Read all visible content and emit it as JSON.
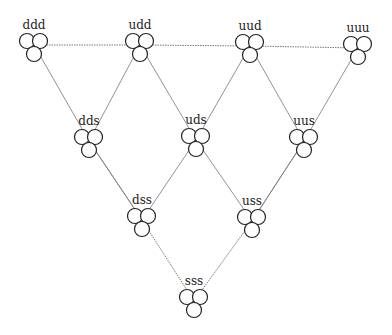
{
  "diagram": {
    "title": "",
    "nodes": [
      {
        "id": "ddd",
        "label": "ddd",
        "x": 34,
        "y": 45
      },
      {
        "id": "udd",
        "label": "udd",
        "x": 140,
        "y": 45
      },
      {
        "id": "uud",
        "label": "uud",
        "x": 250,
        "y": 46
      },
      {
        "id": "uuu",
        "label": "uuu",
        "x": 358,
        "y": 48
      },
      {
        "id": "dds",
        "label": "dds",
        "x": 89,
        "y": 141
      },
      {
        "id": "uds",
        "label": "uds",
        "x": 196,
        "y": 140
      },
      {
        "id": "uus",
        "label": "uus",
        "x": 304,
        "y": 141
      },
      {
        "id": "dss",
        "label": "dss",
        "x": 142,
        "y": 220
      },
      {
        "id": "uss",
        "label": "uss",
        "x": 252,
        "y": 221
      },
      {
        "id": "sss",
        "label": "sss",
        "x": 194,
        "y": 301
      }
    ],
    "edges": [
      {
        "from": "ddd",
        "to": "udd",
        "style": "dotted"
      },
      {
        "from": "udd",
        "to": "uud",
        "style": "dotted"
      },
      {
        "from": "uud",
        "to": "uuu",
        "style": "dotted"
      },
      {
        "from": "ddd",
        "to": "dds",
        "style": "solid"
      },
      {
        "from": "dds",
        "to": "dss",
        "style": "solid"
      },
      {
        "from": "dss",
        "to": "sss",
        "style": "dotted"
      },
      {
        "from": "uuu",
        "to": "uus",
        "style": "solid"
      },
      {
        "from": "uus",
        "to": "uss",
        "style": "solid"
      },
      {
        "from": "uss",
        "to": "sss",
        "style": "dotted"
      },
      {
        "from": "udd",
        "to": "dds",
        "style": "solid"
      },
      {
        "from": "udd",
        "to": "uds",
        "style": "solid"
      },
      {
        "from": "uud",
        "to": "uds",
        "style": "solid"
      },
      {
        "from": "uud",
        "to": "uus",
        "style": "solid"
      },
      {
        "from": "dds",
        "to": "dss",
        "style": "solid"
      },
      {
        "from": "uds",
        "to": "dss",
        "style": "solid"
      },
      {
        "from": "uds",
        "to": "uss",
        "style": "solid"
      },
      {
        "from": "uus",
        "to": "uss",
        "style": "solid"
      }
    ]
  }
}
